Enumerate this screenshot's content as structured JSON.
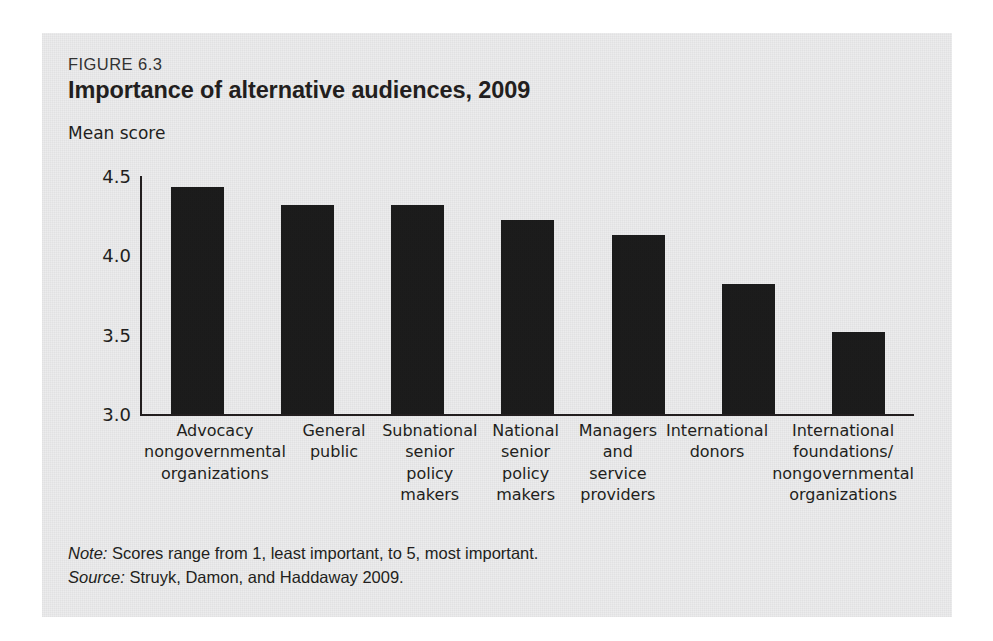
{
  "figure": {
    "label": "FIGURE 6.3",
    "title": "Importance of alternative audiences, 2009",
    "note_lead": "Note:",
    "note_text": " Scores range from 1, least important, to 5, most important.",
    "source_lead": "Source:",
    "source_text": " Struyk, Damon, and Haddaway 2009."
  },
  "colors": {
    "bar": "#1c1c1c",
    "panel_background": "#ececed",
    "axis": "#231f20",
    "text": "#231f20"
  },
  "chart_data": {
    "type": "bar",
    "title": "Importance of alternative audiences, 2009",
    "xlabel": "",
    "ylabel": "Mean score",
    "ylim": [
      3.0,
      4.5
    ],
    "yticks": [
      "3.0",
      "3.5",
      "4.0",
      "4.5"
    ],
    "ytick_values": [
      3.0,
      3.5,
      4.0,
      4.5
    ],
    "grid": false,
    "legend": "none",
    "categories": [
      "Advocacy nongovernmental organizations",
      "General public",
      "Subnational senior policy makers",
      "National senior policy makers",
      "Managers and service providers",
      "International donors",
      "International foundations/ nongovernmental organizations"
    ],
    "category_lines": [
      [
        "Advocacy",
        "nongovernmental",
        "organizations"
      ],
      [
        "General",
        "public"
      ],
      [
        "Subnational",
        "senior",
        "policy makers"
      ],
      [
        "National",
        "senior",
        "policy makers"
      ],
      [
        "Managers",
        "and service",
        "providers"
      ],
      [
        "International",
        "donors"
      ],
      [
        "International",
        "foundations/",
        "nongovernmental",
        "organizations"
      ]
    ],
    "values": [
      4.43,
      4.32,
      4.32,
      4.22,
      4.13,
      3.82,
      3.52
    ]
  }
}
